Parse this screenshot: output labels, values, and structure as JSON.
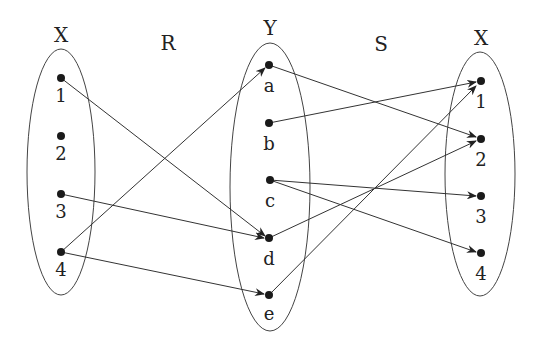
{
  "diagram": {
    "title_labels": {
      "left_set": "X",
      "relation_r": "R",
      "middle_set": "Y",
      "relation_s": "S",
      "right_set": "X"
    },
    "sets": [
      {
        "id": "X_left",
        "name": "X",
        "elements": [
          "1",
          "2",
          "3",
          "4"
        ]
      },
      {
        "id": "Y",
        "name": "Y",
        "elements": [
          "a",
          "b",
          "c",
          "d",
          "e"
        ]
      },
      {
        "id": "X_right",
        "name": "X",
        "elements": [
          "1",
          "2",
          "3",
          "4"
        ]
      }
    ],
    "relations": [
      {
        "name": "R",
        "from": "X",
        "to": "Y",
        "pairs": [
          [
            "1",
            "d"
          ],
          [
            "3",
            "d"
          ],
          [
            "4",
            "a"
          ],
          [
            "4",
            "e"
          ]
        ]
      },
      {
        "name": "S",
        "from": "Y",
        "to": "X",
        "pairs": [
          [
            "a",
            "2"
          ],
          [
            "b",
            "1"
          ],
          [
            "c",
            "3"
          ],
          [
            "c",
            "4"
          ],
          [
            "d",
            "2"
          ],
          [
            "e",
            "1"
          ]
        ]
      }
    ],
    "colors": {
      "stroke": "#333333",
      "dot": "#1a1a1a",
      "text": "#222222"
    }
  }
}
